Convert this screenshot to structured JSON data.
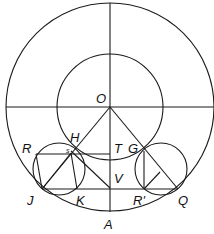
{
  "diagram": {
    "colors": {
      "stroke": "#1a1a1a",
      "background": "#ffffff"
    },
    "center": {
      "label": "O",
      "x": 110,
      "y": 107
    },
    "outer_circle": {
      "cx": 110,
      "cy": 107,
      "r": 104
    },
    "inner_circle": {
      "cx": 110,
      "cy": 107,
      "r": 53
    },
    "left_small_circle": {
      "cx": 59,
      "cy": 169,
      "r": 26
    },
    "right_small_circle": {
      "cx": 161,
      "cy": 169,
      "r": 26
    },
    "labels": {
      "O": "O",
      "H": "H",
      "R": "R",
      "s": "s",
      "T": "T",
      "G": "G",
      "V": "V",
      "J": "J",
      "K": "K",
      "R_prime": "R'",
      "Q": "Q",
      "A": "A"
    },
    "points": {
      "O": [
        110,
        107
      ],
      "H": [
        75,
        147
      ],
      "S": [
        71,
        153
      ],
      "T": [
        110,
        154
      ],
      "G": [
        144,
        151
      ],
      "V": [
        110,
        188
      ],
      "J": [
        42,
        189
      ],
      "K": [
        77,
        189
      ],
      "R_prime": [
        144,
        189
      ],
      "Q": [
        178,
        189
      ],
      "A": [
        110,
        212
      ],
      "R_corner": [
        36,
        154
      ]
    }
  }
}
